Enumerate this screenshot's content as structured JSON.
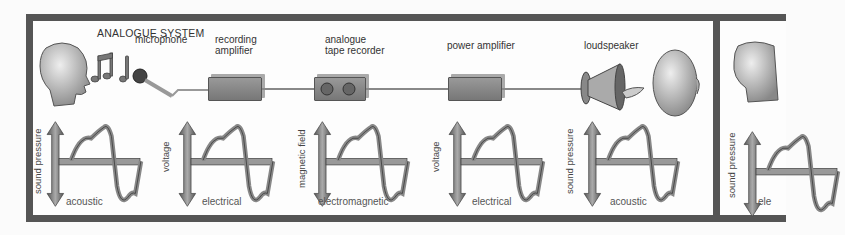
{
  "diagram": {
    "title": "ANALOGUE SYSTEM",
    "components": [
      {
        "id": "microphone",
        "label": "microphone"
      },
      {
        "id": "recording-amplifier",
        "label_line1": "recording",
        "label_line2": "amplifier"
      },
      {
        "id": "analogue-tape-recorder",
        "label_line1": "analogue",
        "label_line2": "tape recorder"
      },
      {
        "id": "power-amplifier",
        "label": "power amplifier"
      },
      {
        "id": "loudspeaker",
        "label": "loudspeaker"
      }
    ],
    "waveforms": [
      {
        "axis_label": "sound pressure",
        "domain_label": "acoustic"
      },
      {
        "axis_label": "voltage",
        "domain_label": "electrical"
      },
      {
        "axis_label": "magnetic field",
        "domain_label": "electromagnetic"
      },
      {
        "axis_label": "voltage",
        "domain_label": "electrical"
      },
      {
        "axis_label": "sound pressure",
        "domain_label": "acoustic"
      }
    ],
    "next_panel": {
      "axis_label": "sound pressure",
      "domain_label_partial": "ele"
    }
  }
}
